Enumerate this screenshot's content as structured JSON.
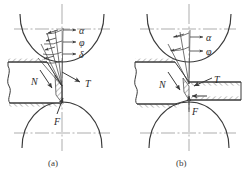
{
  "figure": {
    "colors": {
      "line": "#3a3a3a",
      "centerline": "#8a8a8a",
      "hatch": "#4a4a4a",
      "text": "#2b2b2b",
      "background": "#ffffff"
    }
  },
  "panels": [
    {
      "id": "a",
      "caption": "(a)",
      "labels": {
        "alpha": "α",
        "phi": "φ",
        "delta": "δ",
        "normal_force": "N",
        "tangential_force": "T",
        "feed_force": "F"
      },
      "angle_labels": [
        "α",
        "φ",
        "δ"
      ],
      "force_labels": [
        "N",
        "T",
        "F"
      ]
    },
    {
      "id": "b",
      "caption": "(b)",
      "labels": {
        "alpha": "α",
        "phi": "φ",
        "normal_force": "N",
        "tangential_force": "T",
        "feed_force": "F"
      },
      "angle_labels": [
        "α",
        "φ"
      ],
      "force_labels": [
        "N",
        "T",
        "F"
      ]
    }
  ],
  "elements": {
    "upper_roller": "upper-roller-arc",
    "lower_roller": "lower-roller-arc",
    "workpiece": "hatched-workpiece",
    "vertical_centerline": "vertical-center-line",
    "horizontal_centerline": "horizontal-center-line"
  }
}
